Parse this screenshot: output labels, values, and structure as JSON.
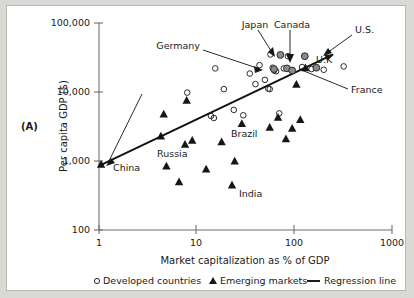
{
  "figure": {
    "panel_label": "(A)"
  },
  "chart_data": {
    "type": "scatter",
    "title": "",
    "xlabel": "Market capitalization as % of GDP",
    "ylabel": "Per capita GDP ($)",
    "xscale": "log",
    "yscale": "log",
    "xlim": [
      1,
      1000
    ],
    "ylim": [
      100,
      100000
    ],
    "xticks": [
      1,
      10,
      100,
      1000
    ],
    "xtick_labels": [
      "1",
      "10",
      "100",
      "1000"
    ],
    "yticks": [
      100,
      1000,
      10000,
      100000
    ],
    "ytick_labels": [
      "100",
      "1,000",
      "10,000",
      "100,000"
    ],
    "grid": false,
    "legend_position": "below-axis",
    "legend": [
      {
        "key": "developed",
        "marker": "open-circle",
        "label": "Developed countries"
      },
      {
        "key": "emerging",
        "marker": "filled-triangle",
        "label": "Emerging markets"
      },
      {
        "key": "regression",
        "marker": "line",
        "label": "Regression line"
      }
    ],
    "series": [
      {
        "name": "Developed countries",
        "marker": "open-circle",
        "points": [
          {
            "x": 8.0,
            "y": 9800
          },
          {
            "x": 14.0,
            "y": 4500
          },
          {
            "x": 15.0,
            "y": 4200
          },
          {
            "x": 15.5,
            "y": 22000
          },
          {
            "x": 19.0,
            "y": 11000
          },
          {
            "x": 24.0,
            "y": 5500
          },
          {
            "x": 30.0,
            "y": 4600
          },
          {
            "x": 35.0,
            "y": 18500
          },
          {
            "x": 40.0,
            "y": 13000
          },
          {
            "x": 44.0,
            "y": 24500
          },
          {
            "x": 50.0,
            "y": 15000
          },
          {
            "x": 54.0,
            "y": 11200
          },
          {
            "x": 56.0,
            "y": 11000
          },
          {
            "x": 57.0,
            "y": 35000
          },
          {
            "x": 60.0,
            "y": 22500
          },
          {
            "x": 62.0,
            "y": 20500
          },
          {
            "x": 65.0,
            "y": 20000
          },
          {
            "x": 70.0,
            "y": 4900
          },
          {
            "x": 78.0,
            "y": 22000
          },
          {
            "x": 86.0,
            "y": 33000
          },
          {
            "x": 120.0,
            "y": 23000
          },
          {
            "x": 150.0,
            "y": 21500
          },
          {
            "x": 200.0,
            "y": 21000
          },
          {
            "x": 320.0,
            "y": 23500
          }
        ]
      },
      {
        "name": "Emerging markets",
        "marker": "filled-triangle",
        "points": [
          {
            "x": 1.05,
            "y": 900
          },
          {
            "x": 4.3,
            "y": 2300
          },
          {
            "x": 4.6,
            "y": 4800
          },
          {
            "x": 4.9,
            "y": 850
          },
          {
            "x": 6.6,
            "y": 500
          },
          {
            "x": 7.6,
            "y": 1750
          },
          {
            "x": 7.9,
            "y": 7600
          },
          {
            "x": 9.0,
            "y": 2000
          },
          {
            "x": 12.5,
            "y": 770
          },
          {
            "x": 18.0,
            "y": 1900
          },
          {
            "x": 23.0,
            "y": 450
          },
          {
            "x": 24.5,
            "y": 1000
          },
          {
            "x": 29.0,
            "y": 3500
          },
          {
            "x": 56.0,
            "y": 3100
          },
          {
            "x": 68.0,
            "y": 4300
          },
          {
            "x": 82.0,
            "y": 2100
          },
          {
            "x": 95.0,
            "y": 3000
          },
          {
            "x": 105.0,
            "y": 13000
          },
          {
            "x": 115.0,
            "y": 4000
          },
          {
            "x": 130.0,
            "y": 22500
          }
        ]
      },
      {
        "name": "Labeled countries",
        "marker": "filled-circle",
        "points": [
          {
            "x": 62.0,
            "y": 21500,
            "label": "Germany"
          },
          {
            "x": 72.0,
            "y": 34500,
            "label": "Japan"
          },
          {
            "x": 84.0,
            "y": 22000,
            "label": "Canada"
          },
          {
            "x": 95.0,
            "y": 20500,
            "label": "France"
          },
          {
            "x": 128.0,
            "y": 33000,
            "label": "U.S."
          },
          {
            "x": 168.0,
            "y": 22500,
            "label": "U.K."
          }
        ]
      }
    ],
    "regression_line": {
      "label": "Regression line",
      "x_start": 1.05,
      "y_start": 880,
      "x_end": 250,
      "y_end": 35000,
      "arrow_end": true
    },
    "annotations": [
      {
        "text": "Germany",
        "target": "Germany"
      },
      {
        "text": "Japan",
        "target": "Japan"
      },
      {
        "text": "Canada",
        "target": "Canada"
      },
      {
        "text": "U.S.",
        "target": "U.S."
      },
      {
        "text": "U.K",
        "target": "U.K."
      },
      {
        "text": "France",
        "target": "France"
      },
      {
        "text": "China",
        "target": "China"
      },
      {
        "text": "Russia",
        "target": "Russia"
      },
      {
        "text": "Brazil",
        "target": "Brazil"
      },
      {
        "text": "India",
        "target": "India"
      }
    ],
    "colors": {
      "developed_marker": "#2b2b2b",
      "emerging_marker": "#161616",
      "highlight_marker": "#8a8a8a",
      "regression": "#111111",
      "axis": "#6e6e6e",
      "text": "#1a1a1a",
      "panel_background": "#ffffff",
      "page_background": "#d9d9d6"
    }
  }
}
